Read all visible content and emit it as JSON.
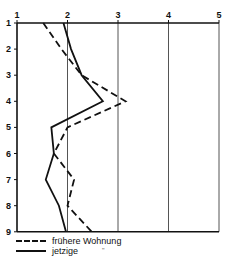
{
  "chart_data": {
    "type": "line",
    "orientation": "vertical-profile",
    "title": "",
    "xlabel": "",
    "ylabel": "",
    "x_ticks": [
      "1",
      "2",
      "3",
      "4",
      "5"
    ],
    "y_ticks": [
      "1",
      "2",
      "3",
      "4",
      "5",
      "6",
      "7",
      "8",
      "9"
    ],
    "xlim": [
      1,
      5
    ],
    "ylim": [
      1,
      9
    ],
    "grid": "vertical lines at x=2,3,4,5",
    "legend_position": "bottom-left",
    "categories": [
      1,
      2,
      3,
      4,
      5,
      6,
      7,
      8,
      9
    ],
    "series": [
      {
        "name": "frühere Wohnung",
        "style": "dashed",
        "values": [
          1.52,
          1.88,
          2.28,
          3.15,
          2.0,
          1.73,
          2.13,
          2.0,
          2.48
        ]
      },
      {
        "name": "jetzige",
        "style": "solid",
        "values": [
          1.92,
          2.07,
          2.28,
          2.7,
          1.68,
          1.73,
          1.57,
          1.83,
          1.97
        ]
      }
    ]
  },
  "legend": {
    "items": [
      {
        "label": "frühere Wohnung",
        "style": "dashed"
      },
      {
        "label": "jetzige",
        "style": "solid",
        "suffix": "\""
      }
    ]
  },
  "colors": {
    "line": "#111111",
    "grid": "#555555",
    "background": "#ffffff"
  }
}
